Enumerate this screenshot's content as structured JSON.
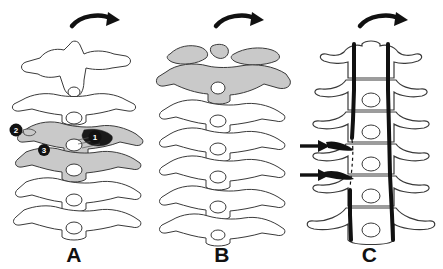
{
  "figure": {
    "background_color": "#ffffff",
    "outline_color": "#3a3a3a",
    "shade_color": "#c9c9c9",
    "dark_color": "#111111",
    "panels": [
      {
        "id": "A",
        "label": "A",
        "view": "lateral",
        "rotation_arrow": "curved-arrow-right",
        "vertebra_count": 6,
        "shaded_vertebrae": [
          3,
          4
        ],
        "markers": [
          {
            "id": "1",
            "label": "1",
            "x": 95,
            "y": 137
          },
          {
            "id": "2",
            "label": "2",
            "x": 16,
            "y": 130
          },
          {
            "id": "3",
            "label": "3",
            "x": 44,
            "y": 150
          }
        ]
      },
      {
        "id": "B",
        "label": "B",
        "view": "lateral",
        "rotation_arrow": "curved-arrow-right",
        "vertebra_count": 6,
        "shaded_vertebrae": [
          1,
          2
        ],
        "markers": []
      },
      {
        "id": "C",
        "label": "C",
        "view": "anteroposterior",
        "rotation_arrow": "curved-arrow-right",
        "vertebra_count": 6,
        "artery_lines": 2,
        "arrows": [
          {
            "id": "upper",
            "label": "arrow-upper",
            "x": 302,
            "y": 145
          },
          {
            "id": "lower",
            "label": "arrow-lower",
            "x": 302,
            "y": 173
          }
        ]
      }
    ]
  }
}
